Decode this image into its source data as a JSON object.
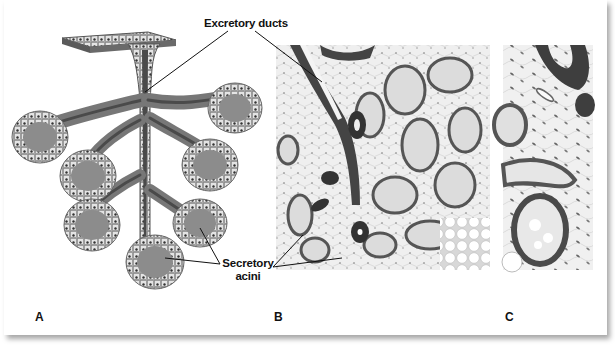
{
  "figure": {
    "panels": [
      {
        "id": "A",
        "label": "A",
        "description": "Schematic of compound acinar gland"
      },
      {
        "id": "B",
        "label": "B",
        "description": "Histology section, low magnification"
      },
      {
        "id": "C",
        "label": "C",
        "description": "Histology section, high magnification"
      }
    ],
    "callouts": {
      "excretory_ducts": "Excretory ducts",
      "secretory_acini_line1": "Secretory",
      "secretory_acini_line2": "acini"
    },
    "colors": {
      "duct_dark": "#4a4a4a",
      "acinus_fill": "#8c8c8c",
      "cell_light": "#e6e6e6",
      "tissue_bg": "#ececec",
      "leader_line": "#111111"
    }
  }
}
